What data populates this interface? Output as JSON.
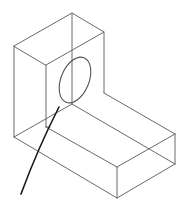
{
  "figure": {
    "colors": {
      "background": "#ffffff",
      "edges": "#6a6a6a",
      "hole": "#555555",
      "leader": "#1a1a1a"
    },
    "upright_block": {
      "top_face": [
        [
          14,
          46
        ],
        [
          72,
          13
        ],
        [
          104,
          32
        ],
        [
          46,
          65
        ]
      ],
      "verticals": [
        [
          [
            14,
            46
          ],
          [
            14,
            137
          ]
        ],
        [
          [
            46,
            65
          ],
          [
            46,
            127
          ]
        ],
        [
          [
            72,
            13
          ],
          [
            72,
            104
          ]
        ],
        [
          [
            104,
            32
          ],
          [
            104,
            93
          ]
        ]
      ]
    },
    "hole": {
      "cx": 75,
      "cy": 80,
      "rx": 14,
      "ry": 24,
      "rotation": 22
    },
    "base_block": {
      "edges": [
        [
          [
            14,
            137
          ],
          [
            117,
            198
          ]
        ],
        [
          [
            14,
            137
          ],
          [
            72,
            104
          ]
        ],
        [
          [
            46,
            127
          ],
          [
            117,
            167
          ]
        ],
        [
          [
            46,
            127
          ],
          [
            50,
            127
          ]
        ],
        [
          [
            72,
            104
          ],
          [
            175,
            164
          ]
        ],
        [
          [
            104,
            93
          ],
          [
            175,
            134
          ]
        ],
        [
          [
            117,
            167
          ],
          [
            175,
            134
          ]
        ],
        [
          [
            117,
            167
          ],
          [
            117,
            198
          ]
        ],
        [
          [
            175,
            134
          ],
          [
            175,
            164
          ]
        ],
        [
          [
            117,
            198
          ],
          [
            175,
            164
          ]
        ]
      ]
    },
    "leader_line": {
      "from": [
        21,
        194
      ],
      "to": [
        59,
        107
      ]
    }
  }
}
